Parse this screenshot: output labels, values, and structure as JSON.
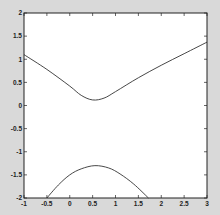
{
  "chart_data": {
    "type": "line",
    "title": "",
    "xlabel": "",
    "ylabel": "",
    "xlim": [
      -1,
      3
    ],
    "ylim": [
      -2,
      2
    ],
    "grid": false,
    "legend": null,
    "xticks": [
      -1,
      -0.5,
      0,
      0.5,
      1,
      1.5,
      2,
      2.5,
      3
    ],
    "xtick_labels": [
      "-1",
      "-0.5",
      "0",
      "0.5",
      "1",
      "1.5",
      "2",
      "2.5",
      "3"
    ],
    "yticks": [
      2,
      1.5,
      1,
      0.5,
      0,
      -0.5,
      -1,
      -1.5,
      -2
    ],
    "ytick_labels": [
      "2",
      "1.5",
      "1",
      "0.5",
      "0",
      "-0.5",
      "-1",
      "-1.5",
      "-2"
    ],
    "series": [
      {
        "name": "upper branch",
        "color": "#333333",
        "x": [
          -1,
          -0.5,
          0,
          0.25,
          0.5,
          0.75,
          1,
          1.5,
          2,
          2.5,
          3
        ],
        "y": [
          1.1,
          0.78,
          0.42,
          0.22,
          0.12,
          0.16,
          0.3,
          0.6,
          0.87,
          1.12,
          1.37
        ]
      },
      {
        "name": "lower branch",
        "color": "#333333",
        "x": [
          -0.5,
          -0.25,
          0,
          0.25,
          0.55,
          0.85,
          1.1,
          1.4,
          1.72
        ],
        "y": [
          -2,
          -1.72,
          -1.5,
          -1.37,
          -1.3,
          -1.35,
          -1.48,
          -1.7,
          -2
        ]
      }
    ]
  },
  "figure": {
    "background": "#d9d9d9",
    "axes_background": "#ffffff",
    "frame_color": "#222222"
  }
}
